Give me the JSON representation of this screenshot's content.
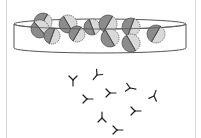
{
  "diagram": {
    "colors": {
      "dish_stroke": "#555555",
      "cell_dark": "#8c8c8c",
      "cell_light": "#d9d9d9",
      "cell_stroke": "#444444",
      "antibody": "#222222",
      "frame": "#d6d6d6"
    },
    "dish": {
      "cx": 100,
      "top_y": 24,
      "bottom_y": 48,
      "rx": 86,
      "ry": 5
    },
    "cells": [
      {
        "x": 43,
        "y": 22,
        "r": 9,
        "angle": 30
      },
      {
        "x": 40,
        "y": 29,
        "r": 9,
        "angle": -40
      },
      {
        "x": 52,
        "y": 36,
        "r": 8,
        "angle": 20
      },
      {
        "x": 68,
        "y": 24,
        "r": 9,
        "angle": -30
      },
      {
        "x": 77,
        "y": 34,
        "r": 8,
        "angle": 30
      },
      {
        "x": 92,
        "y": 27,
        "r": 8,
        "angle": -20
      },
      {
        "x": 108,
        "y": 24,
        "r": 9,
        "angle": 30
      },
      {
        "x": 110,
        "y": 38,
        "r": 9,
        "angle": -30
      },
      {
        "x": 131,
        "y": 27,
        "r": 9,
        "angle": 20
      },
      {
        "x": 131,
        "y": 43,
        "r": 9,
        "angle": -30
      },
      {
        "x": 156,
        "y": 34,
        "r": 9,
        "angle": 30
      }
    ],
    "antibodies": [
      {
        "x": 73,
        "y": 80,
        "rot": 0
      },
      {
        "x": 97,
        "y": 75,
        "rot": 40
      },
      {
        "x": 87,
        "y": 99,
        "rot": -90
      },
      {
        "x": 110,
        "y": 93,
        "rot": 270
      },
      {
        "x": 130,
        "y": 88,
        "rot": -80
      },
      {
        "x": 154,
        "y": 96,
        "rot": 200
      },
      {
        "x": 135,
        "y": 111,
        "rot": -90
      },
      {
        "x": 102,
        "y": 118,
        "rot": 180
      },
      {
        "x": 117,
        "y": 130,
        "rot": -90
      }
    ]
  }
}
